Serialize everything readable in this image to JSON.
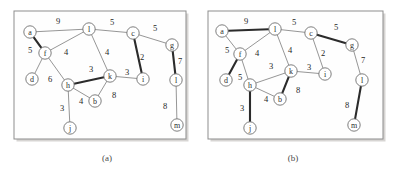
{
  "figure": {
    "width": 397,
    "height": 172,
    "background": "#ffffff"
  },
  "style": {
    "thin_edge_color": "#8a8a8a",
    "bold_edge_color": "#2b2b2b",
    "node_fill": "#ffffff",
    "node_stroke": "#6f6f6f",
    "frame_stroke": "#8d8d8d",
    "text_color": "#1f1f1f"
  },
  "panels": [
    {
      "id": "panel-a",
      "caption": "(a)",
      "caption_x": 107,
      "caption_y": 158,
      "frame": {
        "x": 14,
        "y": 11,
        "width": 172,
        "height": 128
      },
      "nodes": [
        {
          "id": "a",
          "label": "a",
          "x": 30,
          "y": 32,
          "r": 6.2
        },
        {
          "id": "l",
          "label": "l",
          "x": 89,
          "y": 29,
          "r": 6.2
        },
        {
          "id": "c",
          "label": "c",
          "x": 133,
          "y": 33,
          "r": 6.2
        },
        {
          "id": "g",
          "label": "g",
          "x": 172,
          "y": 45,
          "r": 6.2
        },
        {
          "id": "f",
          "label": "f",
          "x": 45,
          "y": 53,
          "r": 6.2
        },
        {
          "id": "d",
          "label": "d",
          "x": 32,
          "y": 79,
          "r": 6.2
        },
        {
          "id": "h",
          "label": "h",
          "x": 68,
          "y": 85,
          "r": 6.2
        },
        {
          "id": "k",
          "label": "k",
          "x": 110,
          "y": 76,
          "r": 6.2
        },
        {
          "id": "b",
          "label": "b",
          "x": 95,
          "y": 101,
          "r": 6.2
        },
        {
          "id": "i",
          "label": "i",
          "x": 143,
          "y": 79,
          "r": 6.2
        },
        {
          "id": "L",
          "label": "l",
          "x": 176,
          "y": 80,
          "r": 6.2
        },
        {
          "id": "j",
          "label": "j",
          "x": 70,
          "y": 128,
          "r": 6.2
        },
        {
          "id": "m",
          "label": "m",
          "x": 177,
          "y": 125,
          "r": 6.2
        }
      ],
      "edges": [
        {
          "from": "a",
          "to": "l",
          "weight": "9",
          "bold": false,
          "wx": 58,
          "wy": 21
        },
        {
          "from": "a",
          "to": "f",
          "weight": "5",
          "bold": true,
          "wx": 30,
          "wy": 50
        },
        {
          "from": "l",
          "to": "c",
          "weight": "5",
          "bold": false,
          "wx": 112,
          "wy": 22
        },
        {
          "from": "l",
          "to": "f",
          "weight": "4",
          "bold": false,
          "wx": 66,
          "wy": 52
        },
        {
          "from": "l",
          "to": "k",
          "weight": "4",
          "bold": false,
          "wx": 107,
          "wy": 52
        },
        {
          "from": "c",
          "to": "g",
          "weight": "5",
          "bold": false,
          "wx": 155,
          "wy": 28
        },
        {
          "from": "c",
          "to": "i",
          "weight": "2",
          "bold": true,
          "wx": 142,
          "wy": 57
        },
        {
          "from": "g",
          "to": "L",
          "weight": "7",
          "bold": true,
          "wx": 180,
          "wy": 61
        },
        {
          "from": "f",
          "to": "d",
          "weight": "",
          "bold": false,
          "wx": 0,
          "wy": 0
        },
        {
          "from": "f",
          "to": "h",
          "weight": "6",
          "bold": false,
          "wx": 50,
          "wy": 79
        },
        {
          "from": "h",
          "to": "k",
          "weight": "3",
          "bold": true,
          "wx": 91,
          "wy": 69
        },
        {
          "from": "h",
          "to": "b",
          "weight": "4",
          "bold": false,
          "wx": 81,
          "wy": 101
        },
        {
          "from": "h",
          "to": "j",
          "weight": "3",
          "bold": false,
          "wx": 62,
          "wy": 108
        },
        {
          "from": "b",
          "to": "k",
          "weight": "8",
          "bold": false,
          "wx": 114,
          "wy": 95
        },
        {
          "from": "k",
          "to": "i",
          "weight": "3",
          "bold": false,
          "wx": 127,
          "wy": 72
        },
        {
          "from": "L",
          "to": "m",
          "weight": "8",
          "bold": false,
          "wx": 165,
          "wy": 106
        }
      ]
    },
    {
      "id": "panel-b",
      "caption": "(b)",
      "caption_x": 293,
      "caption_y": 158,
      "frame": {
        "x": 208,
        "y": 11,
        "width": 175,
        "height": 128
      },
      "nodes": [
        {
          "id": "a",
          "label": "a",
          "x": 222,
          "y": 31,
          "r": 6.2
        },
        {
          "id": "l",
          "label": "l",
          "x": 275,
          "y": 29,
          "r": 6.2
        },
        {
          "id": "c",
          "label": "c",
          "x": 311,
          "y": 33,
          "r": 6.2
        },
        {
          "id": "g",
          "label": "g",
          "x": 352,
          "y": 45,
          "r": 6.2
        },
        {
          "id": "f",
          "label": "f",
          "x": 240,
          "y": 54,
          "r": 6.2
        },
        {
          "id": "d",
          "label": "d",
          "x": 226,
          "y": 80,
          "r": 6.2
        },
        {
          "id": "h",
          "label": "h",
          "x": 250,
          "y": 85,
          "r": 6.2
        },
        {
          "id": "k",
          "label": "k",
          "x": 291,
          "y": 71,
          "r": 6.2
        },
        {
          "id": "b",
          "label": "b",
          "x": 280,
          "y": 99,
          "r": 6.2
        },
        {
          "id": "i",
          "label": "i",
          "x": 325,
          "y": 74,
          "r": 6.2
        },
        {
          "id": "L",
          "label": "l",
          "x": 362,
          "y": 80,
          "r": 6.2
        },
        {
          "id": "j",
          "label": "j",
          "x": 250,
          "y": 128,
          "r": 6.2
        },
        {
          "id": "m",
          "label": "m",
          "x": 354,
          "y": 125,
          "r": 6.2
        }
      ],
      "edges": [
        {
          "from": "a",
          "to": "l",
          "weight": "9",
          "bold": true,
          "wx": 246,
          "wy": 21
        },
        {
          "from": "a",
          "to": "f",
          "weight": "5",
          "bold": false,
          "wx": 227,
          "wy": 50
        },
        {
          "from": "l",
          "to": "c",
          "weight": "5",
          "bold": false,
          "wx": 294,
          "wy": 22
        },
        {
          "from": "l",
          "to": "f",
          "weight": "4",
          "bold": false,
          "wx": 257,
          "wy": 53
        },
        {
          "from": "l",
          "to": "k",
          "weight": "4",
          "bold": false,
          "wx": 290,
          "wy": 50
        },
        {
          "from": "c",
          "to": "g",
          "weight": "5",
          "bold": true,
          "wx": 336,
          "wy": 27
        },
        {
          "from": "c",
          "to": "i",
          "weight": "2",
          "bold": false,
          "wx": 323,
          "wy": 53
        },
        {
          "from": "g",
          "to": "L",
          "weight": "7",
          "bold": false,
          "wx": 363,
          "wy": 60
        },
        {
          "from": "f",
          "to": "d",
          "weight": "5",
          "bold": true,
          "wx": 240,
          "wy": 77
        },
        {
          "from": "f",
          "to": "h",
          "weight": "",
          "bold": false,
          "wx": 0,
          "wy": 0
        },
        {
          "from": "h",
          "to": "k",
          "weight": "3",
          "bold": false,
          "wx": 271,
          "wy": 66
        },
        {
          "from": "h",
          "to": "b",
          "weight": "4",
          "bold": false,
          "wx": 266,
          "wy": 99
        },
        {
          "from": "h",
          "to": "j",
          "weight": "3",
          "bold": true,
          "wx": 242,
          "wy": 108
        },
        {
          "from": "b",
          "to": "k",
          "weight": "8",
          "bold": true,
          "wx": 298,
          "wy": 90
        },
        {
          "from": "k",
          "to": "i",
          "weight": "3",
          "bold": false,
          "wx": 309,
          "wy": 67
        },
        {
          "from": "L",
          "to": "m",
          "weight": "8",
          "bold": true,
          "wx": 347,
          "wy": 105
        }
      ]
    }
  ]
}
